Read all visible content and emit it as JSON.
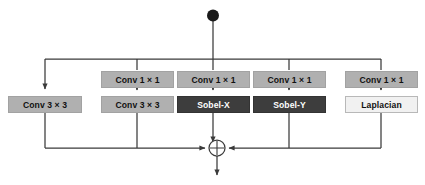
{
  "diagram": {
    "colors": {
      "line": "#3a3a3a",
      "fill_mid": "#b0b0b0",
      "fill_dark": "#3d3d3d",
      "fill_light": "#f1f1f1",
      "background": "#ffffff",
      "text_dark": "#111111",
      "text_light": "#ffffff"
    },
    "input_node": {
      "label": "input-node",
      "shape": "filled-circle"
    },
    "merge_node": {
      "label": "sum-node",
      "shape": "circle-with-plus",
      "operator": "+"
    },
    "branches": [
      {
        "id": "branch-1",
        "blocks": [
          {
            "text": "Conv 3 × 3",
            "style": "fill-mid"
          }
        ]
      },
      {
        "id": "branch-2",
        "blocks": [
          {
            "text": "Conv 1 × 1",
            "style": "fill-mid"
          },
          {
            "text": "Conv 3 × 3",
            "style": "fill-mid"
          }
        ]
      },
      {
        "id": "branch-3",
        "blocks": [
          {
            "text": "Conv 1 × 1",
            "style": "fill-mid"
          },
          {
            "text": "Sobel-X",
            "style": "fill-dark"
          }
        ]
      },
      {
        "id": "branch-4",
        "blocks": [
          {
            "text": "Conv 1 × 1",
            "style": "fill-mid"
          },
          {
            "text": "Sobel-Y",
            "style": "fill-dark"
          }
        ]
      },
      {
        "id": "branch-5",
        "blocks": [
          {
            "text": "Conv 1 × 1",
            "style": "fill-mid"
          },
          {
            "text": "Laplacian",
            "style": "fill-light"
          }
        ]
      }
    ]
  }
}
